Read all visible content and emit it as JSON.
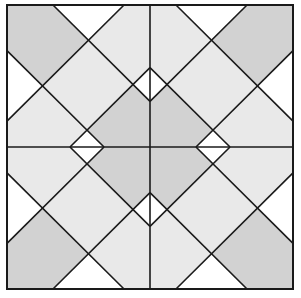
{
  "diagram": {
    "title": "",
    "type": "quilt-block",
    "canvas": {
      "width": 301,
      "height": 298
    },
    "block": {
      "x": 7,
      "y": 5,
      "width": 286,
      "height": 284
    },
    "quadrant_size": 143,
    "colors": {
      "background": "#ffffff",
      "light": "#e9e9e9",
      "dark": "#d2d2d2",
      "white": "#ffffff",
      "stroke": "#1a1a1a"
    },
    "quadrant_template": {
      "description": "Top-left quadrant in local 143x143 units; other quadrants are mirror images about the block center.",
      "patches": [
        {
          "name": "corner-patch",
          "fill": "dark",
          "points": [
            [
              0,
              0
            ],
            [
              46,
              0
            ],
            [
              81.5,
              35.5
            ],
            [
              35.5,
              81.5
            ],
            [
              0,
              46
            ]
          ]
        },
        {
          "name": "top-edge-triangle",
          "fill": "white",
          "points": [
            [
              46,
              0
            ],
            [
              117,
              0
            ],
            [
              81.5,
              35.5
            ]
          ]
        },
        {
          "name": "left-edge-triangle",
          "fill": "white",
          "points": [
            [
              0,
              46
            ],
            [
              35.5,
              81.5
            ],
            [
              0,
              117
            ]
          ]
        },
        {
          "name": "upper-right-patch",
          "fill": "light",
          "points": [
            [
              117,
              0
            ],
            [
              143,
              0
            ],
            [
              143,
              63
            ],
            [
              126,
              80
            ],
            [
              81.5,
              35.5
            ]
          ]
        },
        {
          "name": "lower-left-patch",
          "fill": "light",
          "points": [
            [
              0,
              117
            ],
            [
              35.5,
              81.5
            ],
            [
              80,
              126
            ],
            [
              63,
              143
            ],
            [
              0,
              143
            ]
          ]
        },
        {
          "name": "center-diamond",
          "fill": "light",
          "points": [
            [
              81.5,
              35.5
            ],
            [
              126,
              80
            ],
            [
              80,
              126
            ],
            [
              35.5,
              81.5
            ]
          ]
        },
        {
          "name": "right-edge-triangle",
          "fill": "white",
          "points": [
            [
              143,
              63
            ],
            [
              143,
              97
            ],
            [
              126,
              80
            ]
          ]
        },
        {
          "name": "bottom-edge-triangle",
          "fill": "white",
          "points": [
            [
              63,
              143
            ],
            [
              97,
              143
            ],
            [
              80,
              126
            ]
          ]
        },
        {
          "name": "inner-corner-patch",
          "fill": "dark",
          "points": [
            [
              126,
              80
            ],
            [
              143,
              97
            ],
            [
              143,
              143
            ],
            [
              97,
              143
            ],
            [
              80,
              126
            ]
          ]
        }
      ],
      "lines": [
        [
          [
            46,
            0
          ],
          [
            143,
            97
          ]
        ],
        [
          [
            117,
            0
          ],
          [
            0,
            117
          ]
        ],
        [
          [
            0,
            46
          ],
          [
            97,
            143
          ]
        ],
        [
          [
            63,
            143
          ],
          [
            143,
            63
          ]
        ]
      ]
    },
    "quadrants": [
      {
        "name": "quadrant-top-left",
        "flip_x": false,
        "flip_y": false
      },
      {
        "name": "quadrant-top-right",
        "flip_x": true,
        "flip_y": false
      },
      {
        "name": "quadrant-bottom-left",
        "flip_x": false,
        "flip_y": true
      },
      {
        "name": "quadrant-bottom-right",
        "flip_x": true,
        "flip_y": true
      }
    ],
    "stroke_width": 1.6,
    "border_width": 2
  }
}
